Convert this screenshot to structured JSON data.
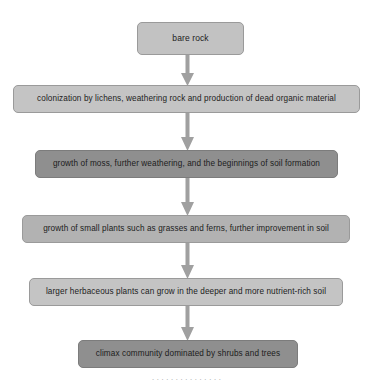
{
  "diagram": {
    "background_color": "#ffffff",
    "arrow_color": "#a0a0a0",
    "arrow_icon": "arrow-down-icon",
    "nodes": [
      {
        "id": "bare-rock",
        "label": "bare rock",
        "fill": "#c2c2c2",
        "border": "#9a9a9a"
      },
      {
        "id": "colonization",
        "label": "colonization by lichens, weathering rock and production of dead organic material",
        "fill": "#c4c4c4",
        "border": "#9a9a9a"
      },
      {
        "id": "moss-growth",
        "label": "growth of moss, further weathering, and the beginnings of soil formation",
        "fill": "#8f8f8f",
        "border": "#7c7c7c"
      },
      {
        "id": "small-plants",
        "label": "growth of small plants such as grasses and ferns, further improvement in soil",
        "fill": "#b2b2b2",
        "border": "#9a9a9a"
      },
      {
        "id": "herbaceous-plants",
        "label": "larger herbaceous plants can grow in the deeper and more nutrient-rich soil",
        "fill": "#c4c4c4",
        "border": "#9a9a9a"
      },
      {
        "id": "climax-community",
        "label": "climax community dominated by shrubs and trees",
        "fill": "#8f8f8f",
        "border": "#7c7c7c"
      }
    ],
    "connectors": [
      {
        "id": "arrow-1",
        "from": "bare-rock",
        "to": "colonization"
      },
      {
        "id": "arrow-2",
        "from": "colonization",
        "to": "moss-growth"
      },
      {
        "id": "arrow-3",
        "from": "moss-growth",
        "to": "small-plants"
      },
      {
        "id": "arrow-4",
        "from": "small-plants",
        "to": "herbaceous-plants"
      },
      {
        "id": "arrow-5",
        "from": "herbaceous-plants",
        "to": "climax-community"
      }
    ],
    "caption_remnant": "the tops of a line of cut-off caption text"
  }
}
